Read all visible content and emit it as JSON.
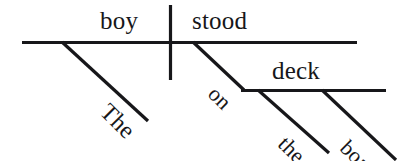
{
  "diagram": {
    "type": "reed-kellogg-sentence-diagram",
    "sentence": "The boy stood on the boat's deck.",
    "ink_color": "#17171a",
    "background_color": "#ffffff",
    "words": {
      "subject": "boy",
      "verb": "stood",
      "subject_article": "The",
      "preposition": "on",
      "object_of_preposition": "deck",
      "object_article": "the",
      "possessive": "boat's"
    },
    "lines": {
      "baseline_main": {
        "x1": 22,
        "y1": 42,
        "x2": 357,
        "y2": 42
      },
      "subject_verb_divider": {
        "x1": 170,
        "y1": 5,
        "x2": 170,
        "y2": 80
      },
      "article_the_slant": {
        "x1": 62,
        "y1": 42,
        "x2": 148,
        "y2": 121
      },
      "preposition_slant": {
        "x1": 193,
        "y1": 42,
        "x2": 243,
        "y2": 90
      },
      "baseline_prep_object": {
        "x1": 242,
        "y1": 90,
        "x2": 386,
        "y2": 90
      },
      "article_the2_slant": {
        "x1": 258,
        "y1": 90,
        "x2": 328,
        "y2": 152
      },
      "possessive_slant": {
        "x1": 322,
        "y1": 90,
        "x2": 394,
        "y2": 158
      }
    }
  }
}
